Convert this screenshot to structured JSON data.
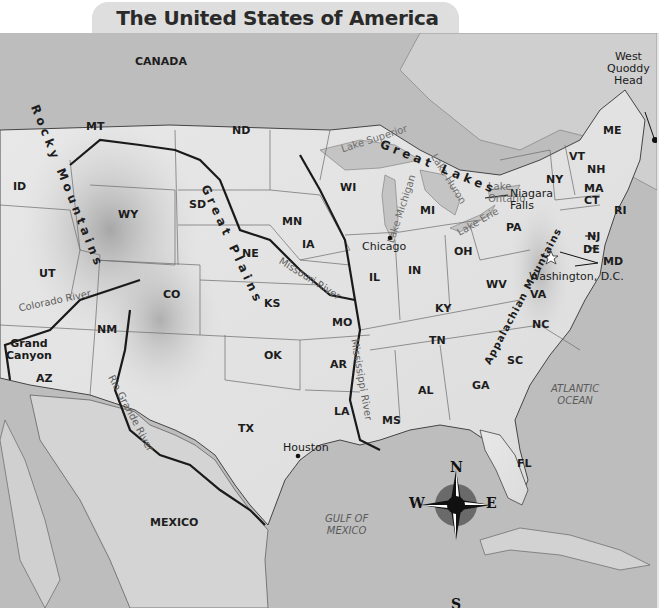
{
  "title": "The United States of America",
  "countries": {
    "canada": "CANADA",
    "mexico": "MEXICO"
  },
  "water_bodies": {
    "atlantic_line1": "ATLANTIC",
    "atlantic_line2": "OCEAN",
    "gulf_line1": "GULF OF",
    "gulf_line2": "MEXICO",
    "lake_superior": "Lake Superior",
    "lake_michigan": "Lake Michigan",
    "lake_huron": "Lake Huron",
    "lake_erie": "Lake Erie",
    "lake_ontario_line1": "Lake",
    "lake_ontario_line2": "Ontario"
  },
  "features": {
    "great_lakes": "Great Lakes",
    "rocky_mountains": "Rocky Mountains",
    "great_plains": "Great Plains",
    "appalachian_mountains": "Appalachian Mountains"
  },
  "rivers": {
    "colorado": "Colorado River",
    "rio_grande": "Rio Grande River",
    "missouri": "Missouri River",
    "mississippi": "Mississippi River"
  },
  "places": {
    "west_quoddy_line1": "West",
    "west_quoddy_line2": "Quoddy",
    "west_quoddy_line3": "Head",
    "niagara_line1": "Niagara",
    "niagara_line2": "Falls",
    "chicago": "Chicago",
    "houston": "Houston",
    "washington": "Washington, D.C.",
    "grand_canyon_line1": "Grand",
    "grand_canyon_line2": "Canyon"
  },
  "states": {
    "MT": "MT",
    "ID": "ID",
    "WY": "WY",
    "UT": "UT",
    "CO": "CO",
    "AZ": "AZ",
    "NM": "NM",
    "ND": "ND",
    "SD": "SD",
    "NE": "NE",
    "KS": "KS",
    "OK": "OK",
    "TX": "TX",
    "MN": "MN",
    "IA": "IA",
    "MO": "MO",
    "AR": "AR",
    "LA": "LA",
    "WI": "WI",
    "IL": "IL",
    "MI": "MI",
    "IN": "IN",
    "OH": "OH",
    "KY": "KY",
    "TN": "TN",
    "MS": "MS",
    "AL": "AL",
    "GA": "GA",
    "FL": "FL",
    "SC": "SC",
    "NC": "NC",
    "VA": "VA",
    "WV": "WV",
    "PA": "PA",
    "NY": "NY",
    "NJ": "NJ",
    "DE": "DE",
    "MD": "MD",
    "VT": "VT",
    "NH": "NH",
    "ME": "ME",
    "MA": "MA",
    "CT": "CT",
    "RI": "RI"
  },
  "compass": {
    "N": "N",
    "S": "S",
    "E": "E",
    "W": "W"
  },
  "colors": {
    "water": "#bdbdbd",
    "land": "#e4e4e4",
    "border": "#555555",
    "river": "#1a1a1a",
    "title_bg": "#dedede"
  }
}
